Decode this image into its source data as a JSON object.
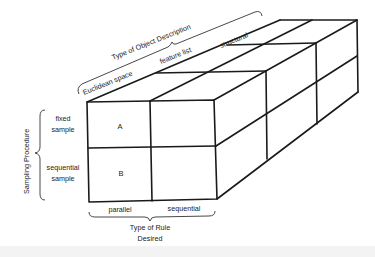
{
  "diagram": {
    "type": "3D cube partition diagram",
    "axes": {
      "depth": {
        "title": "Type of Object Description",
        "categories": [
          "Euclidean space",
          "feature list",
          "structural"
        ]
      },
      "vertical": {
        "title": "Sampling Procedure",
        "categories": [
          "fixed sample",
          "sequential sample"
        ],
        "category_lines": [
          [
            "fixed",
            "sample"
          ],
          [
            "sequential",
            "sample"
          ]
        ]
      },
      "horizontal": {
        "title_lines": [
          "Type of Rule",
          "Desired"
        ],
        "categories": [
          "parallel",
          "sequential"
        ]
      }
    },
    "cells": {
      "fixed_parallel": "A",
      "sequential_parallel": "B"
    },
    "colors": {
      "line": "#1a1a1a",
      "background": "#ffffff",
      "footer_band": "#f3f3f3"
    }
  }
}
